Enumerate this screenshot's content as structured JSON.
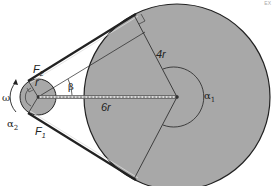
{
  "diagram": {
    "type": "belt-drive",
    "colors": {
      "pulley_fill": "#a8a8a8",
      "stroke": "#222222",
      "background": "#ffffff",
      "shaft_link": "#555555"
    },
    "labels": {
      "F2": "F",
      "F2_sub": "2",
      "F1": "F",
      "F1_sub": "1",
      "omega": "ω",
      "alpha2": "α",
      "alpha2_sub": "2",
      "alpha1": "α",
      "alpha1_sub": "1",
      "beta": "β",
      "small_radius": "r",
      "large_radius": "4r",
      "center_distance": "6r"
    },
    "corner_mark": "EX"
  }
}
